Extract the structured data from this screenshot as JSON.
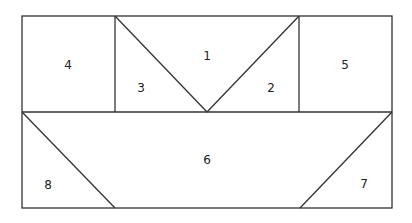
{
  "diagram": {
    "type": "tangram-like rectangle partition",
    "stroke_color": "#333333",
    "background": "#ffffff",
    "regions": [
      {
        "id": "1",
        "label": "1",
        "shape": "inverted triangle",
        "x": 207,
        "y": 56
      },
      {
        "id": "2",
        "label": "2",
        "shape": "right triangle",
        "x": 271,
        "y": 88
      },
      {
        "id": "3",
        "label": "3",
        "shape": "right triangle",
        "x": 141,
        "y": 88
      },
      {
        "id": "4",
        "label": "4",
        "shape": "square",
        "x": 68,
        "y": 65
      },
      {
        "id": "5",
        "label": "5",
        "shape": "square",
        "x": 345,
        "y": 65
      },
      {
        "id": "6",
        "label": "6",
        "shape": "trapezoid",
        "x": 207,
        "y": 160
      },
      {
        "id": "7",
        "label": "7",
        "shape": "right triangle",
        "x": 364,
        "y": 184
      },
      {
        "id": "8",
        "label": "8",
        "shape": "right triangle",
        "x": 48,
        "y": 185
      }
    ]
  }
}
